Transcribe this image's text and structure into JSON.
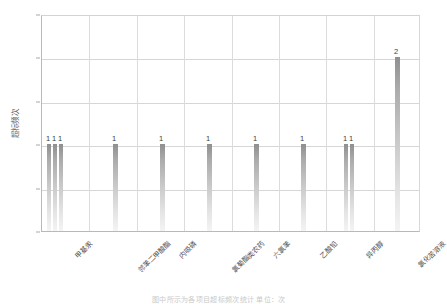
{
  "chart_data": {
    "type": "bar",
    "title": "",
    "xlabel": "",
    "ylabel": "超标频次",
    "ylim": [
      0,
      2.5
    ],
    "ytick_labels": [
      "0",
      "0.5",
      "1",
      "1.5",
      "2",
      "2.5"
    ],
    "ytick_values": [
      0,
      0.5,
      1,
      1.5,
      2,
      2.5
    ],
    "grid": true,
    "legend": "none",
    "categories": [
      "甲基汞",
      "邻苯二甲酸酯",
      "内吸磷",
      "氯菊酯类农药",
      "六氯苯",
      "乙酸铅",
      "异丙醇",
      "氯化苦溶液"
    ],
    "bars": [
      {
        "category_index": 0,
        "x_px": 48,
        "value": 1,
        "label": "1",
        "width_px": 4
      },
      {
        "category_index": 0,
        "x_px": 54,
        "value": 1,
        "label": "1",
        "width_px": 4
      },
      {
        "category_index": 0,
        "x_px": 60,
        "value": 1,
        "label": "1",
        "width_px": 4
      },
      {
        "category_index": 1,
        "x_px": 114,
        "value": 1,
        "label": "1",
        "width_px": 5
      },
      {
        "category_index": 2,
        "x_px": 161,
        "value": 1,
        "label": "1",
        "width_px": 5
      },
      {
        "category_index": 3,
        "x_px": 208,
        "value": 1,
        "label": "1",
        "width_px": 5
      },
      {
        "category_index": 4,
        "x_px": 255,
        "value": 1,
        "label": "1",
        "width_px": 5
      },
      {
        "category_index": 5,
        "x_px": 302,
        "value": 1,
        "label": "1",
        "width_px": 5
      },
      {
        "category_index": 6,
        "x_px": 345,
        "value": 1,
        "label": "1",
        "width_px": 4
      },
      {
        "category_index": 6,
        "x_px": 351,
        "value": 1,
        "label": "1",
        "width_px": 4
      },
      {
        "category_index": 7,
        "x_px": 396,
        "value": 2,
        "label": "2",
        "width_px": 5
      }
    ],
    "series": [
      {
        "name": "超标频次",
        "values": [
          1,
          1,
          1,
          1,
          1,
          1,
          1,
          2
        ]
      }
    ],
    "bar_color_top": "#8f8f8f",
    "bar_color_bottom": "#f4f4f4",
    "gridline_color": "#d6d6d6",
    "axis_color": "#b9b9b9"
  },
  "caption": {
    "cropped_text": "图中所示为各项目超标频次统计      单位：次"
  }
}
